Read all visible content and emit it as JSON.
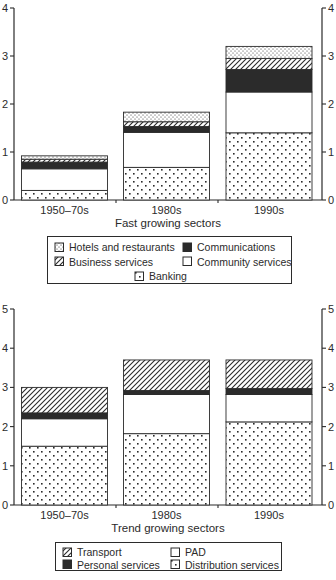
{
  "ink": "#2b2b2b",
  "background": "#ffffff",
  "chart_data": [
    {
      "type": "bar",
      "stacked": true,
      "title": "Fast growing sectors",
      "categories": [
        "1950–70s",
        "1980s",
        "1990s"
      ],
      "ylim": [
        0,
        4
      ],
      "yticks": [
        0,
        1,
        2,
        3,
        4
      ],
      "yaxis_labels": "both-sides",
      "grid": false,
      "legend_position": "below",
      "series": [
        {
          "name": "Banking",
          "pattern": "dots-sparse",
          "values": [
            0.2,
            0.68,
            1.4
          ]
        },
        {
          "name": "Community services",
          "pattern": "white",
          "values": [
            0.45,
            0.73,
            0.85
          ]
        },
        {
          "name": "Communications",
          "pattern": "solid",
          "values": [
            0.14,
            0.12,
            0.47
          ]
        },
        {
          "name": "Business services",
          "pattern": "hatch",
          "values": [
            0.06,
            0.1,
            0.23
          ]
        },
        {
          "name": "Hotels and restaurants",
          "pattern": "dots-fine",
          "values": [
            0.07,
            0.2,
            0.25
          ]
        }
      ],
      "legend_rows": [
        [
          "Hotels and restaurants",
          "Communications"
        ],
        [
          "Business services",
          "Community services"
        ],
        [
          "Banking"
        ]
      ]
    },
    {
      "type": "bar",
      "stacked": true,
      "title": "Trend growing sectors",
      "categories": [
        "1950–70s",
        "1980s",
        "1990s"
      ],
      "ylim": [
        0,
        5
      ],
      "yticks": [
        0,
        1,
        2,
        3,
        4,
        5
      ],
      "yaxis_labels": "both-sides",
      "grid": false,
      "legend_position": "below",
      "series": [
        {
          "name": "Distribution services",
          "pattern": "dots-sparse",
          "values": [
            1.5,
            1.82,
            2.12
          ]
        },
        {
          "name": "PAD",
          "pattern": "white",
          "values": [
            0.7,
            1.0,
            0.7
          ]
        },
        {
          "name": "Personal services",
          "pattern": "solid",
          "values": [
            0.15,
            0.1,
            0.15
          ]
        },
        {
          "name": "Transport",
          "pattern": "hatch",
          "values": [
            0.65,
            0.78,
            0.73
          ]
        }
      ],
      "legend_rows": [
        [
          "Transport",
          "PAD"
        ],
        [
          "Personal services",
          "Distribution services"
        ]
      ]
    }
  ]
}
